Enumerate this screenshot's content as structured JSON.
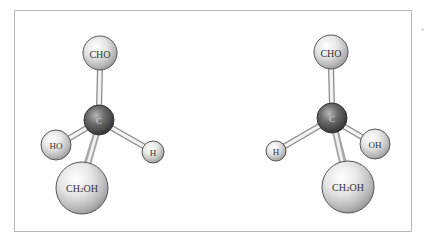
{
  "diagram": {
    "type": "ball-and-stick molecular models",
    "colors": {
      "frame_border": "#b8b8b8",
      "carbon_dark": "#3a3a3a",
      "carbon_light": "#9a9a9a",
      "group_light": "#f4f4f4",
      "group_dark": "#9c9c9c",
      "bond_light": "#f0f0f0",
      "bond_dark": "#8a8a8a",
      "label": "#333333"
    },
    "molecules": [
      {
        "name": "left-enantiomer",
        "center": {
          "label": "C",
          "x": 99,
          "y": 120,
          "r": 15
        },
        "substituents": [
          {
            "label": "CHO",
            "x": 100,
            "y": 53,
            "r": 17,
            "font": 10
          },
          {
            "label": "HO",
            "x": 56,
            "y": 145,
            "r": 15,
            "font": 9
          },
          {
            "label": "H",
            "x": 153,
            "y": 152,
            "r": 11,
            "font": 9
          },
          {
            "label": "CH2OH",
            "x": 82,
            "y": 188,
            "r": 26,
            "font": 10
          }
        ]
      },
      {
        "name": "right-enantiomer",
        "center": {
          "label": "C",
          "x": 332,
          "y": 118,
          "r": 15
        },
        "substituents": [
          {
            "label": "CHO",
            "x": 331,
            "y": 52,
            "r": 17,
            "font": 10
          },
          {
            "label": "H",
            "x": 276,
            "y": 151,
            "r": 10,
            "font": 9
          },
          {
            "label": "OH",
            "x": 375,
            "y": 144,
            "r": 15,
            "font": 9
          },
          {
            "label": "CH2OH",
            "x": 348,
            "y": 187,
            "r": 26,
            "font": 10
          }
        ]
      }
    ]
  },
  "labels": {
    "left_top": "CHO",
    "left_center": "C",
    "left_left": "HO",
    "left_right": "H",
    "left_bottom_main": "CH",
    "left_bottom_sub": "2",
    "left_bottom_tail": "OH",
    "right_top": "CHO",
    "right_center": "C",
    "right_left": "H",
    "right_right": "OH",
    "right_bottom_main": "CH",
    "right_bottom_sub": "2",
    "right_bottom_tail": "OH"
  }
}
